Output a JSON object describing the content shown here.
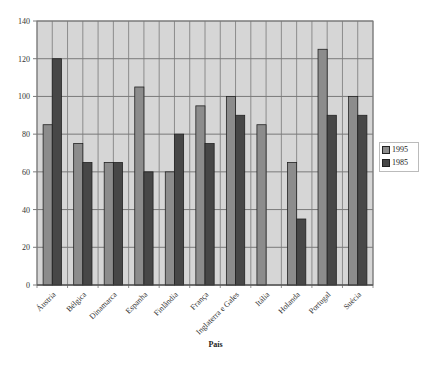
{
  "chart_data": {
    "type": "bar",
    "title": "",
    "xlabel": "País",
    "ylabel": "",
    "ylim": [
      0,
      140
    ],
    "yticks": [
      0,
      20,
      40,
      60,
      80,
      100,
      120,
      140
    ],
    "grid": true,
    "legend_position": "right",
    "categories": [
      "Áustria",
      "Bélgica",
      "Dinamarca",
      "Espanha",
      "Finlândia",
      "França",
      "Inglaterra e Gales",
      "Itália",
      "Holanda",
      "Portugal",
      "Suécia"
    ],
    "series": [
      {
        "name": "1995",
        "color": "#8c8c8c",
        "values": [
          85,
          75,
          65,
          105,
          60,
          95,
          100,
          85,
          65,
          125,
          100
        ]
      },
      {
        "name": "1985",
        "color": "#474747",
        "values": [
          120,
          65,
          65,
          60,
          80,
          75,
          90,
          null,
          35,
          90,
          90
        ]
      }
    ]
  },
  "colors": {
    "plot_background": "#d6d6d6",
    "gridline": "#7a7a7a",
    "bar_border": "#222222"
  }
}
